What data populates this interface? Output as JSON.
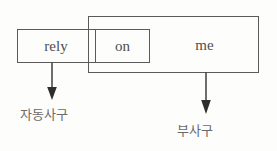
{
  "diagram": {
    "type": "sentence-phrase-bracket-diagram",
    "background_color": "#fdfdfc",
    "line_color": "#5a5a5a",
    "text_color": "#4e4e4e",
    "annotation_color": "#6a6a6a",
    "sentence": "rely on me",
    "words": {
      "rely": "rely",
      "on": "on",
      "me": "me"
    },
    "boxes": [
      {
        "id": "verb-phrase",
        "label": "rely",
        "spans": "rely on",
        "x": 17,
        "y": 29,
        "width": 133,
        "height": 34
      },
      {
        "id": "preposition",
        "label": "on",
        "spans": "on",
        "x": 95,
        "y": 29,
        "width": 55,
        "height": 34
      },
      {
        "id": "prepositional-phrase",
        "label": "me",
        "spans": "on me",
        "x": 88,
        "y": 16,
        "width": 171,
        "height": 57
      }
    ],
    "annotations": [
      {
        "id": "intransitive-verb-phrase",
        "text": "자동사구",
        "points_to": "rely on",
        "arrow_x": 51,
        "arrow_from_y": 62,
        "arrow_to_y": 100
      },
      {
        "id": "adverbial-phrase",
        "text": "부사구",
        "points_to": "on me",
        "arrow_x": 205,
        "arrow_from_y": 72,
        "arrow_to_y": 116
      }
    ]
  }
}
